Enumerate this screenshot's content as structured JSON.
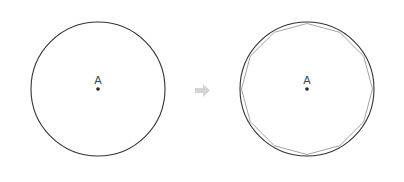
{
  "figure": {
    "left": {
      "center_label": "A",
      "cx": 98,
      "cy": 89,
      "r": 67
    },
    "arrow": {
      "color": "#d4d4d4"
    },
    "right": {
      "center_label": "A",
      "cx": 307,
      "cy": 89,
      "r": 67,
      "polygon_sides": 12
    },
    "stroke_color": "#333333",
    "polygon_color": "#999999"
  }
}
